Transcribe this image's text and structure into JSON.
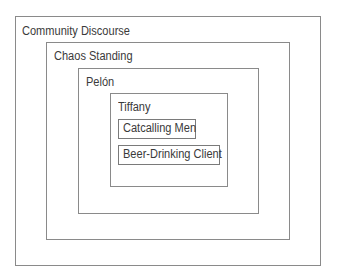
{
  "diagram": {
    "type": "nested-boxes",
    "levels": [
      {
        "label": "Community Discourse"
      },
      {
        "label": "Chaos Standing"
      },
      {
        "label": "Pelón"
      },
      {
        "label": "Tiffany"
      }
    ],
    "innermost_items": [
      {
        "label": "Catcalling Men"
      },
      {
        "label": "Beer-Drinking Client"
      }
    ]
  }
}
